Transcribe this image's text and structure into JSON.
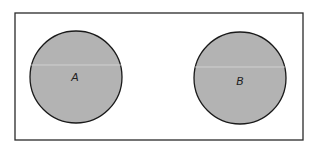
{
  "diagram": {
    "type": "venn",
    "universe_set": {
      "label": ""
    },
    "sets": [
      {
        "id": "A",
        "label": "A",
        "shaded": true
      },
      {
        "id": "B",
        "label": "B",
        "shaded": true
      }
    ],
    "overlap": false,
    "colors": {
      "fill": "#b3b3b3",
      "stroke": "#1a1a1a",
      "background": "#ffffff"
    }
  }
}
